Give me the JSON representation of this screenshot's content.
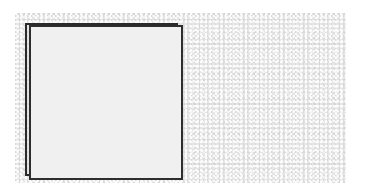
{
  "scene": {
    "panel": {
      "texture": "speckled-gray",
      "color": "#e6e6e6"
    },
    "square": {
      "fill": "#f0f0f0",
      "border": "#2e2e2e",
      "label": ""
    }
  }
}
